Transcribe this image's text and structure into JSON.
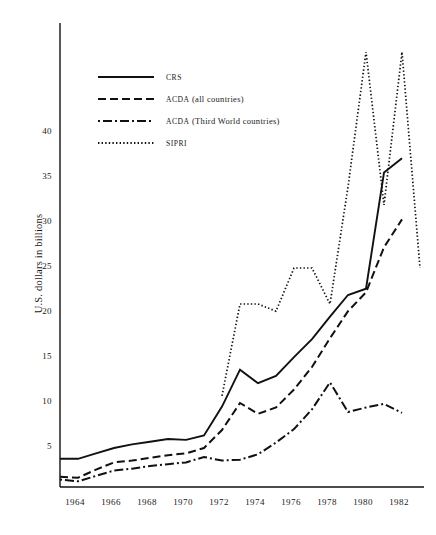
{
  "chart_data": {
    "type": "line",
    "title": "",
    "xlabel": "",
    "ylabel": "U.S. dollars in billions",
    "xlim": [
      1963,
      1983
    ],
    "ylim": [
      0,
      49
    ],
    "grid": false,
    "legend_position": "upper-left",
    "x_ticks": [
      "1964",
      "1966",
      "1968",
      "1970",
      "1972",
      "1974",
      "1976",
      "1978",
      "1980",
      "1982"
    ],
    "x_tick_values": [
      1964,
      1966,
      1968,
      1970,
      1972,
      1974,
      1976,
      1978,
      1980,
      1982
    ],
    "y_ticks": [
      "5",
      "10",
      "15",
      "20",
      "25",
      "30",
      "35",
      "40"
    ],
    "y_tick_values": [
      5,
      10,
      15,
      20,
      25,
      30,
      35,
      40
    ],
    "x": [
      1963,
      1964,
      1965,
      1966,
      1967,
      1968,
      1969,
      1970,
      1971,
      1972,
      1973,
      1974,
      1975,
      1976,
      1977,
      1978,
      1979,
      1980,
      1981,
      1982,
      1983
    ],
    "series": [
      {
        "name": "CRS",
        "style": "solid",
        "color": "#111111",
        "x": [
          1963,
          1964,
          1965,
          1966,
          1967,
          1968,
          1969,
          1970,
          1971,
          1972,
          1973,
          1974,
          1975,
          1976,
          1977,
          1978,
          1979,
          1980,
          1981,
          1982
        ],
        "values": [
          3.8,
          3.8,
          4.4,
          5.0,
          5.4,
          5.7,
          6.0,
          5.9,
          6.4,
          9.6,
          13.7,
          12.2,
          13.0,
          15.1,
          17.1,
          19.6,
          22.0,
          22.7,
          35.6,
          37.2
        ]
      },
      {
        "name": "ACDA (all countries)",
        "style": "dashed",
        "color": "#111111",
        "x": [
          1963,
          1964,
          1965,
          1966,
          1967,
          1968,
          1969,
          1970,
          1971,
          1972,
          1973,
          1974,
          1975,
          1976,
          1977,
          1978,
          1979,
          1980,
          1981,
          1982
        ],
        "values": [
          1.8,
          1.7,
          2.6,
          3.4,
          3.6,
          3.9,
          4.2,
          4.4,
          5.0,
          7.0,
          10.0,
          8.8,
          9.5,
          11.5,
          14.0,
          17.2,
          20.2,
          22.3,
          27.3,
          30.4
        ]
      },
      {
        "name": "ACDA (Third World countries)",
        "style": "dashdot",
        "color": "#111111",
        "x": [
          1963,
          1964,
          1965,
          1966,
          1967,
          1968,
          1969,
          1970,
          1971,
          1972,
          1973,
          1974,
          1975,
          1976,
          1977,
          1978,
          1979,
          1980,
          1981,
          1982
        ],
        "values": [
          1.5,
          1.3,
          1.9,
          2.5,
          2.7,
          3.0,
          3.2,
          3.4,
          4.0,
          3.6,
          3.7,
          4.3,
          5.6,
          7.1,
          9.3,
          12.3,
          9.0,
          9.5,
          9.9,
          8.9
        ]
      },
      {
        "name": "SIPRI",
        "style": "dotted",
        "color": "#111111",
        "x": [
          1972,
          1973,
          1974,
          1975,
          1976,
          1977,
          1978,
          1979,
          1980,
          1981,
          1982,
          1983
        ],
        "values": [
          10.8,
          21.0,
          21.0,
          20.2,
          25.0,
          25.0,
          21.0,
          34.0,
          49.0,
          32.0,
          49.0,
          25.0
        ]
      }
    ]
  },
  "legend": {
    "items": [
      {
        "label": "CRS",
        "style": "solid"
      },
      {
        "label_prefix": "ACDA",
        "label_rest": " (all countries)",
        "style": "dashed"
      },
      {
        "label_prefix": "ACDA",
        "label_rest": " (Third World countries)",
        "style": "dashdot"
      },
      {
        "label": "SIPRI",
        "style": "dotted"
      }
    ]
  },
  "axes": {
    "y_title": "U.S. dollars in billions"
  }
}
